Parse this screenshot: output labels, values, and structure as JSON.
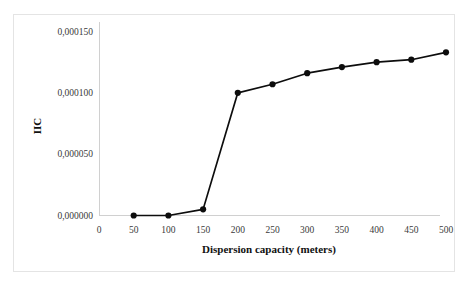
{
  "chart_data": {
    "type": "line",
    "title": "",
    "subtitle": "",
    "xlabel": "Dispersion capacity (meters)",
    "ylabel": "IIC",
    "x": [
      50,
      100,
      150,
      200,
      250,
      300,
      350,
      400,
      450,
      500
    ],
    "values": [
      0.0,
      0.0,
      5e-06,
      0.0001,
      0.000107,
      0.000116,
      0.000121,
      0.000125,
      0.000127,
      0.000133
    ],
    "series": [
      {
        "name": "IIC",
        "x": [
          50,
          100,
          150,
          200,
          250,
          300,
          350,
          400,
          450,
          500
        ],
        "values": [
          0.0,
          0.0,
          5e-06,
          0.0001,
          0.000107,
          0.000116,
          0.000121,
          0.000125,
          0.000127,
          0.000133
        ]
      }
    ],
    "xlim": [
      0,
      520
    ],
    "ylim": [
      0.0,
      0.00015
    ],
    "xticks": [
      0,
      50,
      100,
      150,
      200,
      250,
      300,
      350,
      400,
      450,
      500
    ],
    "xtick_labels": [
      "0",
      "50",
      "100",
      "150",
      "200",
      "250",
      "300",
      "350",
      "400",
      "450",
      "500"
    ],
    "yticks": [
      0.0,
      5e-05,
      0.0001,
      0.00015
    ],
    "ytick_labels": [
      "0,000000",
      "0,000050",
      "0,000100",
      "0,000150"
    ],
    "grid": false,
    "legend": false,
    "legend_position": "none",
    "decimal_separator": ",",
    "marker": "filled-circle",
    "line_color": "#0d0d0d",
    "marker_color": "#0d0d0d",
    "axis_color": "#d0d0d0",
    "frame_color": "#e4e4e4",
    "background_color": "#ffffff"
  },
  "figure": {
    "frame_label": "chart-frame",
    "plot_area_label": "plot-area"
  }
}
